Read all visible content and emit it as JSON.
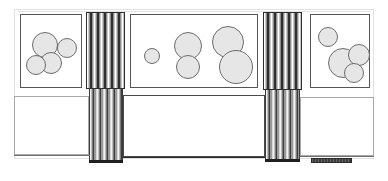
{
  "drawing": {
    "title": "Building Elevation",
    "type": "architectural-elevation",
    "canvas": {
      "width": 388,
      "height": 181
    },
    "background_color": "#ffffff",
    "line_color": "#3a3a3a",
    "fill_color": "#e6e6e6",
    "accent_dark": "#2e2e2e"
  },
  "sheet": {
    "label": "drawing-sheet",
    "x": 14,
    "y": 9,
    "width": 360,
    "height": 150,
    "border_color": "#e2e2e2"
  },
  "bays": [
    {
      "id": "left-upper-bay",
      "label": "Left glazed bay",
      "x": 20,
      "y": 14,
      "width": 62,
      "height": 74,
      "border_color": "#555555",
      "fill": "#ffffff",
      "circles": [
        {
          "id": "left-c1",
          "cx": 24,
          "cy": 30,
          "r": 13
        },
        {
          "id": "left-c2",
          "cx": 46,
          "cy": 33,
          "r": 10
        },
        {
          "id": "left-c3",
          "cx": 30,
          "cy": 48,
          "r": 11
        },
        {
          "id": "left-c4",
          "cx": 15,
          "cy": 50,
          "r": 10
        }
      ]
    },
    {
      "id": "center-upper-bay",
      "label": "Centre glazed bay",
      "x": 130,
      "y": 14,
      "width": 128,
      "height": 74,
      "border_color": "#555555",
      "fill": "#ffffff",
      "circles": [
        {
          "id": "mid-c1",
          "cx": 21,
          "cy": 41,
          "r": 8
        },
        {
          "id": "mid-c2",
          "cx": 57,
          "cy": 31,
          "r": 14
        },
        {
          "id": "mid-c3",
          "cx": 57,
          "cy": 52,
          "r": 12
        },
        {
          "id": "mid-c4",
          "cx": 97,
          "cy": 27,
          "r": 16
        },
        {
          "id": "mid-c5",
          "cx": 105,
          "cy": 52,
          "r": 17
        }
      ]
    },
    {
      "id": "right-upper-bay",
      "label": "Right glazed bay",
      "x": 310,
      "y": 14,
      "width": 60,
      "height": 74,
      "border_color": "#555555",
      "fill": "#ffffff",
      "circles": [
        {
          "id": "right-c1",
          "cx": 17,
          "cy": 22,
          "r": 10
        },
        {
          "id": "right-c2",
          "cx": 32,
          "cy": 48,
          "r": 15
        },
        {
          "id": "right-c3",
          "cx": 48,
          "cy": 40,
          "r": 11
        },
        {
          "id": "right-c4",
          "cx": 43,
          "cy": 58,
          "r": 10
        }
      ]
    }
  ],
  "louvres": [
    {
      "id": "left-louvre-upper",
      "label": "Left louvre column, upper",
      "x": 86,
      "y": 12,
      "width": 39,
      "height": 77
    },
    {
      "id": "left-louvre-lower",
      "label": "Left louvre column, lower",
      "x": 89,
      "y": 89,
      "width": 34,
      "height": 74
    },
    {
      "id": "right-louvre-upper",
      "label": "Right louvre column, upper",
      "x": 263,
      "y": 12,
      "width": 39,
      "height": 78
    },
    {
      "id": "right-louvre-lower",
      "label": "Right louvre column, lower",
      "x": 265,
      "y": 90,
      "width": 35,
      "height": 72
    }
  ],
  "lower_panels": [
    {
      "id": "left-lower-panel",
      "label": "Left lower wall panel",
      "x": 14,
      "y": 96,
      "width": 75,
      "height": 59,
      "border_color": "#9a9a9a"
    },
    {
      "id": "center-lower-panel",
      "label": "Centre lower wall panel",
      "x": 123,
      "y": 95,
      "width": 142,
      "height": 62,
      "border_color": "#3a3a3a"
    },
    {
      "id": "right-lower-panel",
      "label": "Right lower wall panel",
      "x": 300,
      "y": 97,
      "width": 74,
      "height": 59,
      "border_color": "#9a9a9a"
    }
  ],
  "rules": [
    {
      "id": "top-datum",
      "x": 18,
      "y": 11,
      "width": 352,
      "height": 1,
      "color": "#e2e2e2"
    },
    {
      "id": "mid-datum-left",
      "x": 14,
      "y": 95,
      "width": 76,
      "height": 1,
      "color": "#b5b5b5"
    },
    {
      "id": "mid-datum-right",
      "x": 300,
      "y": 96,
      "width": 74,
      "height": 1,
      "color": "#b5b5b5"
    },
    {
      "id": "ground-line-left",
      "x": 14,
      "y": 155,
      "width": 76,
      "height": 1,
      "color": "#6f6f6f"
    },
    {
      "id": "ground-line-center",
      "x": 123,
      "y": 157,
      "width": 142,
      "height": 1,
      "color": "#2b2b2b"
    },
    {
      "id": "ground-line-right",
      "x": 300,
      "y": 156,
      "width": 74,
      "height": 1,
      "color": "#6f6f6f"
    }
  ],
  "louvre_caps": [
    {
      "id": "left-louvre-base-cap",
      "x": 89,
      "y": 160,
      "width": 34,
      "height": 3
    },
    {
      "id": "right-louvre-base-cap",
      "x": 265,
      "y": 159,
      "width": 35,
      "height": 3
    }
  ],
  "plinth": {
    "id": "bottom-right-plinth",
    "label": "Plinth / ramp detail",
    "x": 311,
    "y": 158,
    "width": 41,
    "height": 5
  }
}
